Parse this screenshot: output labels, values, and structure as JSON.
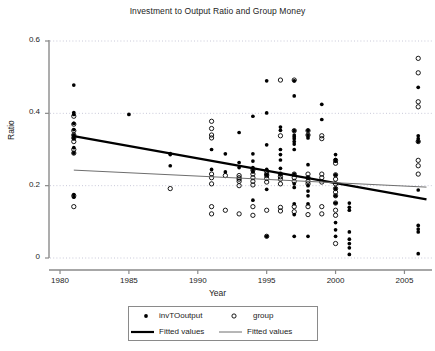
{
  "chart_data": {
    "type": "scatter",
    "title": "Investment to Output Ratio and Group Money",
    "xlabel": "Year",
    "ylabel": "Ratio",
    "xlim": [
      1979.2,
      1007.0
    ],
    "xlim_years": [
      1979.2,
      2007.0
    ],
    "ylim": [
      -0.02,
      0.63
    ],
    "xticks": [
      1980,
      1985,
      1990,
      1995,
      2000,
      2005
    ],
    "xticklabels": [
      "1980",
      "1985",
      "1990",
      "1995",
      "2000",
      "2005"
    ],
    "yticks": [
      0,
      0.2,
      0.4,
      0.6
    ],
    "yticklabels": [
      "0",
      "0.2",
      "0.4",
      "0.6"
    ],
    "grid": "horizontal-dotted",
    "legend_position": "below-axes",
    "series": [
      {
        "name": "invTOoutput",
        "marker": "filled-circle",
        "color": "#000000",
        "points": [
          [
            1981,
            0.478
          ],
          [
            1981,
            0.402
          ],
          [
            1981,
            0.397
          ],
          [
            1981,
            0.372
          ],
          [
            1981,
            0.355
          ],
          [
            1981,
            0.34
          ],
          [
            1981,
            0.335
          ],
          [
            1981,
            0.33
          ],
          [
            1981,
            0.305
          ],
          [
            1981,
            0.29
          ],
          [
            1981,
            0.175
          ],
          [
            1981,
            0.168
          ],
          [
            1985,
            0.397
          ],
          [
            1988,
            0.289
          ],
          [
            1988,
            0.286
          ],
          [
            1988,
            0.255
          ],
          [
            1991,
            0.3
          ],
          [
            1991,
            0.245
          ],
          [
            1992,
            0.288
          ],
          [
            1992,
            0.238
          ],
          [
            1993,
            0.347
          ],
          [
            1993,
            0.264
          ],
          [
            1993,
            0.25
          ],
          [
            1994,
            0.392
          ],
          [
            1994,
            0.288
          ],
          [
            1994,
            0.268
          ],
          [
            1994,
            0.25
          ],
          [
            1994,
            0.243
          ],
          [
            1994,
            0.238
          ],
          [
            1994,
            0.16
          ],
          [
            1995,
            0.49
          ],
          [
            1995,
            0.401
          ],
          [
            1995,
            0.313
          ],
          [
            1995,
            0.245
          ],
          [
            1995,
            0.23
          ],
          [
            1995,
            0.19
          ],
          [
            1995,
            0.06
          ],
          [
            1996,
            0.362
          ],
          [
            1996,
            0.353
          ],
          [
            1996,
            0.3
          ],
          [
            1996,
            0.286
          ],
          [
            1996,
            0.271
          ],
          [
            1996,
            0.248
          ],
          [
            1996,
            0.232
          ],
          [
            1997,
            0.49
          ],
          [
            1997,
            0.448
          ],
          [
            1997,
            0.352
          ],
          [
            1997,
            0.34
          ],
          [
            1997,
            0.335
          ],
          [
            1997,
            0.33
          ],
          [
            1997,
            0.322
          ],
          [
            1997,
            0.315
          ],
          [
            1997,
            0.3
          ],
          [
            1997,
            0.232
          ],
          [
            1997,
            0.205
          ],
          [
            1997,
            0.195
          ],
          [
            1997,
            0.15
          ],
          [
            1997,
            0.12
          ],
          [
            1997,
            0.06
          ],
          [
            1998,
            0.353
          ],
          [
            1998,
            0.34
          ],
          [
            1998,
            0.332
          ],
          [
            1998,
            0.258
          ],
          [
            1998,
            0.222
          ],
          [
            1998,
            0.2
          ],
          [
            1998,
            0.185
          ],
          [
            1998,
            0.172
          ],
          [
            1998,
            0.15
          ],
          [
            1998,
            0.06
          ],
          [
            1999,
            0.425
          ],
          [
            1999,
            0.383
          ],
          [
            2000,
            0.286
          ],
          [
            2000,
            0.272
          ],
          [
            2000,
            0.268
          ],
          [
            2000,
            0.23
          ],
          [
            2000,
            0.192
          ],
          [
            2000,
            0.172
          ],
          [
            2000,
            0.152
          ],
          [
            2000,
            0.098
          ],
          [
            2000,
            0.078
          ],
          [
            2000,
            0.06
          ],
          [
            2001,
            0.152
          ],
          [
            2001,
            0.14
          ],
          [
            2001,
            0.132
          ],
          [
            2001,
            0.072
          ],
          [
            2001,
            0.052
          ],
          [
            2001,
            0.04
          ],
          [
            2001,
            0.028
          ],
          [
            2001,
            0.01
          ],
          [
            2006,
            0.472
          ],
          [
            2006,
            0.338
          ],
          [
            2006,
            0.33
          ],
          [
            2006,
            0.322
          ],
          [
            2006,
            0.188
          ],
          [
            2006,
            0.09
          ],
          [
            2006,
            0.08
          ],
          [
            2006,
            0.072
          ],
          [
            2006,
            0.012
          ]
        ]
      },
      {
        "name": "group",
        "marker": "open-circle",
        "color": "#000000",
        "points": [
          [
            1981,
            0.392
          ],
          [
            1981,
            0.37
          ],
          [
            1981,
            0.352
          ],
          [
            1981,
            0.34
          ],
          [
            1981,
            0.332
          ],
          [
            1981,
            0.322
          ],
          [
            1981,
            0.3
          ],
          [
            1981,
            0.29
          ],
          [
            1981,
            0.172
          ],
          [
            1981,
            0.142
          ],
          [
            1988,
            0.192
          ],
          [
            1991,
            0.378
          ],
          [
            1991,
            0.358
          ],
          [
            1991,
            0.34
          ],
          [
            1991,
            0.332
          ],
          [
            1991,
            0.232
          ],
          [
            1991,
            0.222
          ],
          [
            1991,
            0.205
          ],
          [
            1991,
            0.142
          ],
          [
            1991,
            0.122
          ],
          [
            1992,
            0.228
          ],
          [
            1992,
            0.132
          ],
          [
            1993,
            0.228
          ],
          [
            1993,
            0.222
          ],
          [
            1993,
            0.218
          ],
          [
            1993,
            0.212
          ],
          [
            1993,
            0.2
          ],
          [
            1993,
            0.122
          ],
          [
            1994,
            0.243
          ],
          [
            1994,
            0.232
          ],
          [
            1994,
            0.222
          ],
          [
            1994,
            0.212
          ],
          [
            1994,
            0.202
          ],
          [
            1994,
            0.142
          ],
          [
            1994,
            0.118
          ],
          [
            1995,
            0.24
          ],
          [
            1995,
            0.232
          ],
          [
            1995,
            0.228
          ],
          [
            1995,
            0.22
          ],
          [
            1995,
            0.21
          ],
          [
            1995,
            0.132
          ],
          [
            1995,
            0.06
          ],
          [
            1996,
            0.492
          ],
          [
            1996,
            0.338
          ],
          [
            1996,
            0.232
          ],
          [
            1996,
            0.225
          ],
          [
            1996,
            0.218
          ],
          [
            1996,
            0.205
          ],
          [
            1996,
            0.14
          ],
          [
            1996,
            0.13
          ],
          [
            1997,
            0.492
          ],
          [
            1997,
            0.352
          ],
          [
            1997,
            0.232
          ],
          [
            1997,
            0.222
          ],
          [
            1997,
            0.212
          ],
          [
            1997,
            0.142
          ],
          [
            1997,
            0.128
          ],
          [
            1998,
            0.352
          ],
          [
            1998,
            0.34
          ],
          [
            1998,
            0.232
          ],
          [
            1998,
            0.222
          ],
          [
            1998,
            0.212
          ],
          [
            1998,
            0.205
          ],
          [
            1998,
            0.142
          ],
          [
            1998,
            0.12
          ],
          [
            1999,
            0.338
          ],
          [
            1999,
            0.33
          ],
          [
            1999,
            0.232
          ],
          [
            1999,
            0.222
          ],
          [
            1999,
            0.21
          ],
          [
            1999,
            0.142
          ],
          [
            1999,
            0.122
          ],
          [
            2000,
            0.27
          ],
          [
            2000,
            0.262
          ],
          [
            2000,
            0.23
          ],
          [
            2000,
            0.218
          ],
          [
            2000,
            0.205
          ],
          [
            2000,
            0.192
          ],
          [
            2000,
            0.182
          ],
          [
            2000,
            0.172
          ],
          [
            2000,
            0.152
          ],
          [
            2000,
            0.132
          ],
          [
            2000,
            0.118
          ],
          [
            2000,
            0.04
          ],
          [
            2006,
            0.552
          ],
          [
            2006,
            0.512
          ],
          [
            2006,
            0.432
          ],
          [
            2006,
            0.418
          ],
          [
            2006,
            0.322
          ],
          [
            2006,
            0.27
          ],
          [
            2006,
            0.255
          ],
          [
            2006,
            0.232
          ]
        ]
      }
    ],
    "fits": [
      {
        "name": "Fitted values",
        "for": "invTOoutput",
        "style": "thick",
        "color": "#000000",
        "width": 2.2,
        "x": [
          1981.0,
          2006.6
        ],
        "y": [
          0.337,
          0.162
        ]
      },
      {
        "name": "Fitted values",
        "for": "group",
        "style": "thin",
        "color": "#6e6e6e",
        "width": 1.0,
        "x": [
          1981.0,
          2006.6
        ],
        "y": [
          0.243,
          0.196
        ]
      }
    ],
    "legend_entries": [
      {
        "label": "invTOoutput",
        "symbol": "filled-circle"
      },
      {
        "label": "group",
        "symbol": "open-circle"
      },
      {
        "label": "Fitted values",
        "symbol": "thick-line"
      },
      {
        "label": "Fitted values",
        "symbol": "thin-line"
      }
    ]
  },
  "colors": {
    "axis": "#8a8a8a",
    "grid": "#c8c8d8",
    "marker": "#000000",
    "fit_thick": "#000000",
    "fit_thin": "#6e6e6e",
    "text": "#1c1c1c",
    "legend_border": "#8a8a8a"
  }
}
